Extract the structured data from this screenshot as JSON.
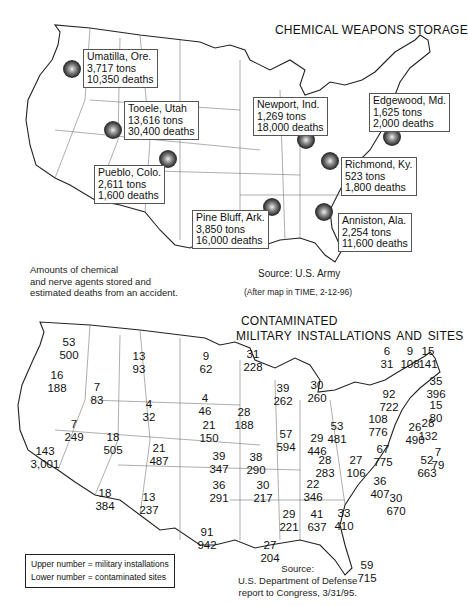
{
  "map1": {
    "title": "CHEMICAL WEAPONS STORAGE",
    "sites": [
      {
        "name": "Umatilla, Ore.",
        "tons": "3,717 tons",
        "deaths": "10,350 deaths"
      },
      {
        "name": "Tooele, Utah",
        "tons": "13,616 tons",
        "deaths": "30,400 deaths"
      },
      {
        "name": "Pueblo, Colo.",
        "tons": "2,611 tons",
        "deaths": "1,600 deaths"
      },
      {
        "name": "Newport, Ind.",
        "tons": "1,269 tons",
        "deaths": "18,000 deaths"
      },
      {
        "name": "Edgewood, Md.",
        "tons": "1,625 tons",
        "deaths": "2,000 deaths"
      },
      {
        "name": "Richmond, Ky.",
        "tons": "523 tons",
        "deaths": "1,800 deaths"
      },
      {
        "name": "Pine Bluff, Ark.",
        "tons": "3,850 tons",
        "deaths": "16,000 deaths"
      },
      {
        "name": "Anniston, Ala.",
        "tons": "2,254 tons",
        "deaths": "11,600 deaths"
      }
    ],
    "note": [
      "Amounts of chemical",
      "and nerve agents stored and",
      "estimated deaths from an accident."
    ],
    "source": "Source: U.S. Army",
    "after": "(After map in TIME, 2-12-96)"
  },
  "map2": {
    "title_line1": "CONTAMINATED",
    "title_line2": "MILITARY INSTALLATIONS AND SITES",
    "states": [
      {
        "state": "WA",
        "upper": "53",
        "lower": "500"
      },
      {
        "state": "OR",
        "upper": "16",
        "lower": "188"
      },
      {
        "state": "ID",
        "upper": "7",
        "lower": "83"
      },
      {
        "state": "MT",
        "upper": "13",
        "lower": "93"
      },
      {
        "state": "ND",
        "upper": "9",
        "lower": "62"
      },
      {
        "state": "MN",
        "upper": "31",
        "lower": "228"
      },
      {
        "state": "SD",
        "upper": "4",
        "lower": "46"
      },
      {
        "state": "WY",
        "upper": "4",
        "lower": "32"
      },
      {
        "state": "NV",
        "upper": "7",
        "lower": "249"
      },
      {
        "state": "CA",
        "upper": "143",
        "lower": "3,001"
      },
      {
        "state": "UT",
        "upper": "18",
        "lower": "505"
      },
      {
        "state": "CO",
        "upper": "21",
        "lower": "487"
      },
      {
        "state": "NE",
        "upper": "21",
        "lower": "150"
      },
      {
        "state": "KS",
        "upper": "39",
        "lower": "347"
      },
      {
        "state": "AZ",
        "upper": "18",
        "lower": "384"
      },
      {
        "state": "NM",
        "upper": "13",
        "lower": "237"
      },
      {
        "state": "OK",
        "upper": "36",
        "lower": "291"
      },
      {
        "state": "TX",
        "upper": "91",
        "lower": "942"
      },
      {
        "state": "IA",
        "upper": "28",
        "lower": "188"
      },
      {
        "state": "WI",
        "upper": "39",
        "lower": "262"
      },
      {
        "state": "MI",
        "upper": "30",
        "lower": "260"
      },
      {
        "state": "IL",
        "upper": "57",
        "lower": "594"
      },
      {
        "state": "IN",
        "upper": "29",
        "lower": "446"
      },
      {
        "state": "OH",
        "upper": "53",
        "lower": "481"
      },
      {
        "state": "MO",
        "upper": "38",
        "lower": "290"
      },
      {
        "state": "KY",
        "upper": "28",
        "lower": "283"
      },
      {
        "state": "WV",
        "upper": "27",
        "lower": "106"
      },
      {
        "state": "VA",
        "upper": "67",
        "lower": "775"
      },
      {
        "state": "PA",
        "upper": "108",
        "lower": "776"
      },
      {
        "state": "NY",
        "upper": "92",
        "lower": "722"
      },
      {
        "state": "AR",
        "upper": "30",
        "lower": "217"
      },
      {
        "state": "TN",
        "upper": "22",
        "lower": "346"
      },
      {
        "state": "NC",
        "upper": "36",
        "lower": "407"
      },
      {
        "state": "SC",
        "upper": "30",
        "lower": "670"
      },
      {
        "state": "MS",
        "upper": "29",
        "lower": "221"
      },
      {
        "state": "AL",
        "upper": "41",
        "lower": "637"
      },
      {
        "state": "GA",
        "upper": "33",
        "lower": "410"
      },
      {
        "state": "LA",
        "upper": "27",
        "lower": "204"
      },
      {
        "state": "FL",
        "upper": "59",
        "lower": "715"
      },
      {
        "state": "VT",
        "upper": "6",
        "lower": "31"
      },
      {
        "state": "NH",
        "upper": "9",
        "lower": "108"
      },
      {
        "state": "ME",
        "upper": "15",
        "lower": "141"
      },
      {
        "state": "MA",
        "upper": "35",
        "lower": "396"
      },
      {
        "state": "RI",
        "upper": "15",
        "lower": "80"
      },
      {
        "state": "CT",
        "upper": "28",
        "lower": "132"
      },
      {
        "state": "NJ",
        "upper": "26",
        "lower": "490"
      },
      {
        "state": "DE",
        "upper": "7",
        "lower": "79"
      },
      {
        "state": "MD",
        "upper": "52",
        "lower": "663"
      }
    ],
    "legend": {
      "upper": "Upper number = military installations",
      "lower": "Lower number = contaminated sites"
    },
    "source": [
      "Source:",
      "U.S. Department of Defense",
      "report to Congress, 3/31/95."
    ]
  }
}
